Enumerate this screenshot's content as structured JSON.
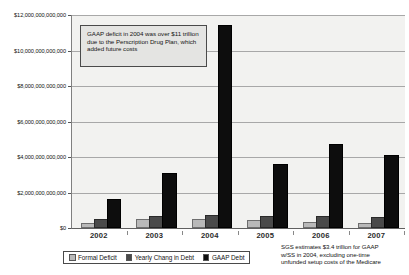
{
  "chart_data": {
    "type": "bar",
    "title": "",
    "xlabel": "",
    "ylabel": "",
    "grid": true,
    "legend_position": "bottom",
    "ylim": [
      0,
      12000000000000
    ],
    "ytick_step": 2000000000000,
    "ytick_labels": [
      "$12,000,000,000,000",
      "$10,000,000,000,000",
      "$8,000,000,000,000",
      "$6,000,000,000,000",
      "$4,000,000,000,000",
      "$2,000,000,000,000",
      "$0"
    ],
    "ytick_values": [
      12000000000000,
      10000000000000,
      8000000000000,
      6000000000000,
      4000000000000,
      2000000000000,
      0
    ],
    "categories": [
      "2002",
      "2003",
      "2004",
      "2005",
      "2006",
      "2007"
    ],
    "series": [
      {
        "name": "Formal Deficit",
        "color": "#b9b9b9",
        "values": [
          160000000000,
          380000000000,
          410000000000,
          320000000000,
          250000000000,
          160000000000
        ]
      },
      {
        "name": "Yearly Chang in Debt",
        "color": "#4a4a4a",
        "values": [
          420000000000,
          550000000000,
          600000000000,
          550000000000,
          570000000000,
          500000000000
        ]
      },
      {
        "name": "GAAP Debt",
        "color": "#0d0d0d",
        "values": [
          1500000000000,
          3000000000000,
          11300000000000,
          3500000000000,
          4600000000000,
          4000000000000
        ]
      }
    ],
    "annotations": [
      {
        "id": "callout",
        "text": "GAAP deficit in 2004 was over $11 trillion due to the Perscription Drug Plan, which added future costs"
      },
      {
        "id": "footnote",
        "lines": [
          "SGS estimates $3.4 trillion for GAAP",
          "w/SS in 2004, excluding one-time",
          "unfunded setup costs of the Medicare"
        ]
      }
    ]
  },
  "callout": {
    "text": "GAAP deficit in 2004 was over $11 trillion due to the Perscription Drug Plan, which added future costs"
  },
  "legend": {
    "items": [
      {
        "label": "Formal Deficit"
      },
      {
        "label": "Yearly Chang in Debt"
      },
      {
        "label": "GAAP Debt"
      }
    ]
  },
  "footnote": {
    "line1": "SGS estimates $3.4 trillion for GAAP",
    "line2": "w/SS in 2004, excluding one-time",
    "line3": "unfunded setup costs of the Medicare"
  }
}
